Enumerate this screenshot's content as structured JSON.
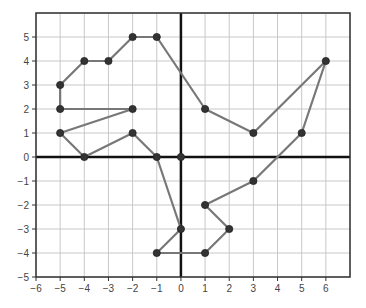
{
  "chart_data": {
    "type": "scatter",
    "title": "",
    "xlabel": "",
    "ylabel": "",
    "xlim": [
      -6,
      7
    ],
    "ylim": [
      -5,
      6
    ],
    "grid": true,
    "legend": null,
    "x_ticks": [
      -6,
      -5,
      -4,
      -3,
      -2,
      -1,
      0,
      1,
      2,
      3,
      4,
      5,
      6
    ],
    "y_ticks": [
      -5,
      -4,
      -3,
      -2,
      -1,
      0,
      1,
      2,
      3,
      4,
      5
    ],
    "x_tick_labels": [
      "−6",
      "−5",
      "−4",
      "−3",
      "−2",
      "−1",
      "0",
      "1",
      "2",
      "3",
      "4",
      "5",
      "6"
    ],
    "y_tick_labels": [
      "−5",
      "−4",
      "−3",
      "−2",
      "−1",
      "0",
      "1",
      "2",
      "3",
      "4",
      "5"
    ],
    "series": [
      {
        "name": "outline",
        "closed": true,
        "points": [
          [
            -1,
            5
          ],
          [
            -2,
            5
          ],
          [
            -3,
            4
          ],
          [
            -4,
            4
          ],
          [
            -5,
            3
          ],
          [
            -5,
            2
          ],
          [
            -2,
            2
          ],
          [
            -5,
            1
          ],
          [
            -4,
            0
          ],
          [
            -2,
            1
          ],
          [
            -1,
            0
          ],
          [
            0,
            -3
          ],
          [
            -1,
            -4
          ],
          [
            1,
            -4
          ],
          [
            2,
            -3
          ],
          [
            1,
            -2
          ],
          [
            3,
            -1
          ],
          [
            5,
            1
          ],
          [
            6,
            4
          ],
          [
            3,
            1
          ],
          [
            1,
            2
          ]
        ]
      },
      {
        "name": "origin",
        "closed": false,
        "points": [
          [
            0,
            0
          ]
        ]
      }
    ],
    "colors": {
      "line": "#777777",
      "point": "#333333",
      "grid": "#c8c8c8",
      "axis": "#111111",
      "frame": "#333333"
    }
  }
}
